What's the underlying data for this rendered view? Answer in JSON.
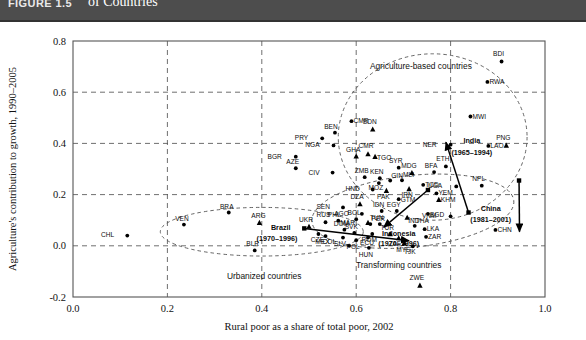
{
  "header": {
    "figure_number": "FIGURE 1.5",
    "title_line1": "Agriculture's Contribution to Growth and the Rural Share of Poverty Differ across the Three",
    "title_line2": "of Countries",
    "band_color": "#4d4d4d"
  },
  "chart_data": {
    "type": "scatter",
    "title": "",
    "xlabel": "Rural poor as a share of total poor, 2002",
    "ylabel": "Agriculture's contribution to growth, 1990–2005",
    "xlim": [
      0.0,
      1.0
    ],
    "ylim": [
      -0.2,
      0.8
    ],
    "xticks": [
      "0.0",
      "0.2",
      "0.4",
      "0.6",
      "0.8",
      "1.0"
    ],
    "yticks": [
      "-0.2",
      "0.0",
      "0.2",
      "0.4",
      "0.6",
      "0.8"
    ],
    "grid": true,
    "legend": "none",
    "points": [
      {
        "label": "CHL",
        "x": 0.115,
        "y": 0.04,
        "marker": "circle",
        "lbl_dx": -13,
        "lbl_dy": 1
      },
      {
        "label": "VEN",
        "x": 0.235,
        "y": 0.083,
        "marker": "circle",
        "lbl_dx": -2,
        "lbl_dy": -4
      },
      {
        "label": "BRA",
        "x": 0.33,
        "y": 0.13,
        "marker": "circle",
        "lbl_dx": -2,
        "lbl_dy": -4
      },
      {
        "label": "ARG",
        "x": 0.395,
        "y": 0.09,
        "marker": "triangle",
        "lbl_dx": -1,
        "lbl_dy": -5
      },
      {
        "label": "BLR",
        "x": 0.385,
        "y": -0.018,
        "marker": "circle",
        "lbl_dx": -2,
        "lbl_dy": -4
      },
      {
        "label": "UKR",
        "x": 0.5,
        "y": 0.075,
        "marker": "triangle",
        "lbl_dx": -3,
        "lbl_dy": -5
      },
      {
        "label": "RUS",
        "x": 0.535,
        "y": 0.092,
        "marker": "circle",
        "lbl_dx": -2,
        "lbl_dy": -5
      },
      {
        "label": "CZE",
        "x": 0.52,
        "y": 0.046,
        "marker": "circle",
        "lbl_dx": -1,
        "lbl_dy": 8
      },
      {
        "label": "COL",
        "x": 0.585,
        "y": 0.0,
        "marker": "circle",
        "lbl_dx": -13,
        "lbl_dy": -2
      },
      {
        "label": "MEX",
        "x": 0.535,
        "y": 0.038,
        "marker": "circle",
        "lbl_dx": -3,
        "lbl_dy": 8
      },
      {
        "label": "SLV",
        "x": 0.572,
        "y": 0.032,
        "marker": "circle",
        "lbl_dx": -3,
        "lbl_dy": 8
      },
      {
        "label": "DOM",
        "x": 0.575,
        "y": 0.063,
        "marker": "circle",
        "lbl_dx": -3,
        "lbl_dy": -4
      },
      {
        "label": "SVK",
        "x": 0.596,
        "y": 0.05,
        "marker": "circle",
        "lbl_dx": -3,
        "lbl_dy": -4
      },
      {
        "label": "POL",
        "x": 0.6,
        "y": 0.022,
        "marker": "circle",
        "lbl_dx": -3,
        "lbl_dy": 9
      },
      {
        "label": "ECU",
        "x": 0.625,
        "y": 0.032,
        "marker": "circle",
        "lbl_dx": -1,
        "lbl_dy": 7
      },
      {
        "label": "PHL",
        "x": 0.562,
        "y": 0.098,
        "marker": "circle",
        "lbl_dx": -4,
        "lbl_dy": -4
      },
      {
        "label": "BOL",
        "x": 0.6,
        "y": 0.104,
        "marker": "circle",
        "lbl_dx": -2,
        "lbl_dy": -4
      },
      {
        "label": "PER",
        "x": 0.63,
        "y": 0.085,
        "marker": "circle",
        "lbl_dx": 1,
        "lbl_dy": -3
      },
      {
        "label": "TUR",
        "x": 0.672,
        "y": 0.046,
        "marker": "triangle",
        "lbl_dx": -3,
        "lbl_dy": -4
      },
      {
        "label": "ZAF",
        "x": 0.69,
        "y": 0.03,
        "marker": "triangle",
        "lbl_dx": -4,
        "lbl_dy": 8
      },
      {
        "label": "MYS",
        "x": 0.702,
        "y": 0.01,
        "marker": "triangle",
        "lbl_dx": -1,
        "lbl_dy": 9
      },
      {
        "label": "HUN",
        "x": 0.627,
        "y": -0.008,
        "marker": "circle",
        "lbl_dx": -3,
        "lbl_dy": 9
      },
      {
        "label": "BGR",
        "x": 0.472,
        "y": 0.348,
        "marker": "circle",
        "lbl_dx": -14,
        "lbl_dy": 2
      },
      {
        "label": "AZE",
        "x": 0.472,
        "y": 0.303,
        "marker": "circle",
        "lbl_dx": -3,
        "lbl_dy": -4
      },
      {
        "label": "PRY",
        "x": 0.528,
        "y": 0.42,
        "marker": "circle",
        "lbl_dx": -14,
        "lbl_dy": 2
      },
      {
        "label": "BEN",
        "x": 0.555,
        "y": 0.442,
        "marker": "circle",
        "lbl_dx": -4,
        "lbl_dy": -4
      },
      {
        "label": "NGA",
        "x": 0.552,
        "y": 0.392,
        "marker": "circle",
        "lbl_dx": -14,
        "lbl_dy": 2
      },
      {
        "label": "CIV",
        "x": 0.55,
        "y": 0.286,
        "marker": "circle",
        "lbl_dx": -13,
        "lbl_dy": 2
      },
      {
        "label": "GHA",
        "x": 0.6,
        "y": 0.35,
        "marker": "triangle",
        "lbl_dx": -3,
        "lbl_dy": -4
      },
      {
        "label": "CMR",
        "x": 0.625,
        "y": 0.358,
        "marker": "triangle",
        "lbl_dx": -2,
        "lbl_dy": -6
      },
      {
        "label": "TGO",
        "x": 0.64,
        "y": 0.348,
        "marker": "triangle",
        "lbl_dx": 2,
        "lbl_dy": 3
      },
      {
        "label": "CMR",
        "x": 0.59,
        "y": 0.487,
        "marker": "circle",
        "lbl_dx": 2,
        "lbl_dy": 2
      },
      {
        "label": "SDN",
        "x": 0.635,
        "y": 0.455,
        "marker": "triangle",
        "lbl_dx": -3,
        "lbl_dy": -5
      },
      {
        "label": "ZMB",
        "x": 0.618,
        "y": 0.268,
        "marker": "circle",
        "lbl_dx": -3,
        "lbl_dy": -4
      },
      {
        "label": "KEN",
        "x": 0.65,
        "y": 0.264,
        "marker": "circle",
        "lbl_dx": -3,
        "lbl_dy": -4
      },
      {
        "label": "MOZ",
        "x": 0.648,
        "y": 0.245,
        "marker": "circle",
        "lbl_dx": -3,
        "lbl_dy": 7
      },
      {
        "label": "GIN",
        "x": 0.672,
        "y": 0.255,
        "marker": "circle",
        "lbl_dx": 1,
        "lbl_dy": -3
      },
      {
        "label": "MLI",
        "x": 0.697,
        "y": 0.256,
        "marker": "circle",
        "lbl_dx": 1,
        "lbl_dy": -3
      },
      {
        "label": "SYR",
        "x": 0.69,
        "y": 0.305,
        "marker": "circle",
        "lbl_dx": -3,
        "lbl_dy": -5
      },
      {
        "label": "MDG",
        "x": 0.718,
        "y": 0.285,
        "marker": "triangle",
        "lbl_dx": -3,
        "lbl_dy": -5
      },
      {
        "label": "HND",
        "x": 0.635,
        "y": 0.22,
        "marker": "circle",
        "lbl_dx": -13,
        "lbl_dy": 2
      },
      {
        "label": "PAK",
        "x": 0.664,
        "y": 0.215,
        "marker": "triangle",
        "lbl_dx": -3,
        "lbl_dy": 8
      },
      {
        "label": "IRN",
        "x": 0.712,
        "y": 0.222,
        "marker": "triangle",
        "lbl_dx": -2,
        "lbl_dy": 8
      },
      {
        "label": "GTM",
        "x": 0.69,
        "y": 0.182,
        "marker": "circle",
        "lbl_dx": 2,
        "lbl_dy": 3
      },
      {
        "label": "TCD",
        "x": 0.742,
        "y": 0.238,
        "marker": "circle",
        "lbl_dx": 2,
        "lbl_dy": 2
      },
      {
        "label": "BFA",
        "x": 0.765,
        "y": 0.288,
        "marker": "circle",
        "lbl_dx": -3,
        "lbl_dy": -4
      },
      {
        "label": "ETH",
        "x": 0.79,
        "y": 0.31,
        "marker": "circle",
        "lbl_dx": -3,
        "lbl_dy": -5
      },
      {
        "label": "UGA",
        "x": 0.812,
        "y": 0.232,
        "marker": "circle",
        "lbl_dx": -14,
        "lbl_dy": 2
      },
      {
        "label": "YEM",
        "x": 0.77,
        "y": 0.205,
        "marker": "circle",
        "lbl_dx": 2,
        "lbl_dy": 2
      },
      {
        "label": "KHM",
        "x": 0.775,
        "y": 0.18,
        "marker": "triangle",
        "lbl_dx": 2,
        "lbl_dy": 2
      },
      {
        "label": "NPL",
        "x": 0.866,
        "y": 0.235,
        "marker": "circle",
        "lbl_dx": -3,
        "lbl_dy": -5
      },
      {
        "label": "DZA",
        "x": 0.608,
        "y": 0.163,
        "marker": "triangle",
        "lbl_dx": -3,
        "lbl_dy": -5
      },
      {
        "label": "AGO",
        "x": 0.612,
        "y": 0.125,
        "marker": "circle",
        "lbl_dx": -13,
        "lbl_dy": 2
      },
      {
        "label": "IDN",
        "x": 0.654,
        "y": 0.136,
        "marker": "circle",
        "lbl_dx": -3,
        "lbl_dy": -4
      },
      {
        "label": "EGY",
        "x": 0.686,
        "y": 0.136,
        "marker": "circle",
        "lbl_dx": -3,
        "lbl_dy": -4
      },
      {
        "label": "MAR",
        "x": 0.625,
        "y": 0.09,
        "marker": "triangle",
        "lbl_dx": -13,
        "lbl_dy": 2
      },
      {
        "label": "TUN",
        "x": 0.65,
        "y": 0.085,
        "marker": "circle",
        "lbl_dx": -3,
        "lbl_dy": -4
      },
      {
        "label": "ROM",
        "x": 0.634,
        "y": 0.046,
        "marker": "circle",
        "lbl_dx": -3,
        "lbl_dy": 8
      },
      {
        "label": "IND",
        "x": 0.708,
        "y": 0.11,
        "marker": "triangle",
        "lbl_dx": 1,
        "lbl_dy": 5
      },
      {
        "label": "THA",
        "x": 0.724,
        "y": 0.078,
        "marker": "circle",
        "lbl_dx": 1,
        "lbl_dy": -3
      },
      {
        "label": "BGD",
        "x": 0.752,
        "y": 0.125,
        "marker": "circle",
        "lbl_dx": 2,
        "lbl_dy": 3
      },
      {
        "label": "LKA",
        "x": 0.745,
        "y": 0.065,
        "marker": "circle",
        "lbl_dx": 2,
        "lbl_dy": 2
      },
      {
        "label": "ZAR",
        "x": 0.748,
        "y": 0.035,
        "marker": "circle",
        "lbl_dx": 2,
        "lbl_dy": 2
      },
      {
        "label": "VNM",
        "x": 0.8,
        "y": 0.115,
        "marker": "circle",
        "lbl_dx": -14,
        "lbl_dy": 2
      },
      {
        "label": "TJK",
        "x": 0.72,
        "y": -0.002,
        "marker": "circle",
        "lbl_dx": -3,
        "lbl_dy": 8
      },
      {
        "label": "SEN",
        "x": 0.572,
        "y": 0.15,
        "marker": "circle",
        "lbl_dx": -13,
        "lbl_dy": 2
      },
      {
        "label": "CHN",
        "x": 0.895,
        "y": 0.062,
        "marker": "circle",
        "lbl_dx": 2,
        "lbl_dy": 2
      },
      {
        "label": "LAO",
        "x": 0.88,
        "y": 0.39,
        "marker": "circle",
        "lbl_dx": 2,
        "lbl_dy": 2
      },
      {
        "label": "PNG",
        "x": 0.918,
        "y": 0.392,
        "marker": "triangle",
        "lbl_dx": -3,
        "lbl_dy": -5
      },
      {
        "label": "NER",
        "x": 0.8,
        "y": 0.395,
        "marker": "circle",
        "lbl_dx": -14,
        "lbl_dy": 2
      },
      {
        "label": "MWI",
        "x": 0.842,
        "y": 0.505,
        "marker": "circle",
        "lbl_dx": 2,
        "lbl_dy": 2
      },
      {
        "label": "RWA",
        "x": 0.878,
        "y": 0.64,
        "marker": "circle",
        "lbl_dx": 2,
        "lbl_dy": 2
      },
      {
        "label": "BDI",
        "x": 0.908,
        "y": 0.72,
        "marker": "circle",
        "lbl_dx": -3,
        "lbl_dy": -5
      },
      {
        "label": "ZWE",
        "x": 0.735,
        "y": -0.155,
        "marker": "triangle",
        "lbl_dx": -3,
        "lbl_dy": -5
      }
    ],
    "cluster_ellipses": [
      {
        "name": "agriculture-based",
        "cx": 0.762,
        "cy": 0.425,
        "rx": 0.2,
        "ry": 0.325,
        "rot": 0
      },
      {
        "name": "transforming",
        "cx": 0.72,
        "cy": 0.135,
        "rx": 0.215,
        "ry": 0.14,
        "rot": -6
      },
      {
        "name": "urbanized",
        "cx": 0.4,
        "cy": 0.055,
        "rx": 0.215,
        "ry": 0.095,
        "rot": 0
      }
    ],
    "cluster_labels": [
      {
        "text": "Agriculture-based countries",
        "x": 0.737,
        "y": 0.69
      },
      {
        "text": "Transforming countries",
        "x": 0.69,
        "y": -0.085
      },
      {
        "text": "Urbanized countries",
        "x": 0.405,
        "y": -0.13
      }
    ],
    "trajectories": [
      {
        "name": "India (1965–1994)",
        "label": "India",
        "sublabel": "(1965–1994)",
        "x1": 0.838,
        "y1": 0.13,
        "x2": 0.79,
        "y2": 0.405,
        "lbl_x": 0.845,
        "lbl_y": 0.4,
        "sub_x": 0.845,
        "sub_y": 0.355
      },
      {
        "name": "China (1981–2001)",
        "label": "China",
        "sublabel": "(1981–2001)",
        "x1": 0.945,
        "y1": 0.255,
        "x2": 0.946,
        "y2": 0.055,
        "lbl_x": 0.885,
        "lbl_y": 0.135,
        "sub_x": 0.885,
        "sub_y": 0.092
      },
      {
        "name": "Indonesia (1970–1996)",
        "label": "Indonesia",
        "sublabel": "(1970–1996)",
        "x1": 0.752,
        "y1": 0.218,
        "x2": 0.658,
        "y2": 0.072,
        "lbl_x": 0.69,
        "lbl_y": 0.04,
        "sub_x": 0.69,
        "sub_y": -0.002
      },
      {
        "name": "Brazil (1970–1996)",
        "label": "Brazil",
        "sublabel": "(1970–1996)",
        "x1": 0.49,
        "y1": 0.068,
        "x2": 0.712,
        "y2": 0.02,
        "lbl_x": 0.44,
        "lbl_y": 0.062,
        "sub_x": 0.432,
        "sub_y": 0.02
      }
    ]
  }
}
